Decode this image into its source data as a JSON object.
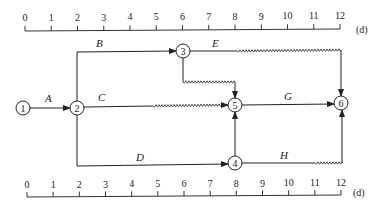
{
  "diagram": {
    "type": "time-scaled network diagram",
    "unit_label": "(d)",
    "time_axis": {
      "ticks": [
        "0",
        "1",
        "2",
        "3",
        "4",
        "5",
        "6",
        "7",
        "8",
        "9",
        "10",
        "11",
        "12"
      ]
    },
    "nodes": [
      {
        "id": "1",
        "label": "1",
        "time": 0
      },
      {
        "id": "2",
        "label": "2",
        "time": 2
      },
      {
        "id": "3",
        "label": "3",
        "time": 6
      },
      {
        "id": "4",
        "label": "4",
        "time": 8
      },
      {
        "id": "5",
        "label": "5",
        "time": 8
      },
      {
        "id": "6",
        "label": "6",
        "time": 12
      }
    ],
    "activities": [
      {
        "label": "A",
        "from": "1",
        "to": "2",
        "duration": 2,
        "free_float": 0
      },
      {
        "label": "B",
        "from": "2",
        "to": "3",
        "duration": 4,
        "free_float": 0
      },
      {
        "label": "C",
        "from": "2",
        "to": "5",
        "duration": 3,
        "free_float": 3
      },
      {
        "label": "D",
        "from": "2",
        "to": "4",
        "duration": 6,
        "free_float": 0
      },
      {
        "label": "E",
        "from": "3",
        "to": "6",
        "duration": 2,
        "free_float": 4
      },
      {
        "label": "G",
        "from": "5",
        "to": "6",
        "duration": 4,
        "free_float": 0
      },
      {
        "label": "H",
        "from": "4",
        "to": "6",
        "duration": 3,
        "free_float": 1
      },
      {
        "label": "",
        "from": "3",
        "to": "5",
        "duration": 0,
        "free_float": 2,
        "dummy": true
      },
      {
        "label": "",
        "from": "4",
        "to": "5",
        "duration": 0,
        "free_float": 0,
        "dummy": true
      }
    ]
  }
}
